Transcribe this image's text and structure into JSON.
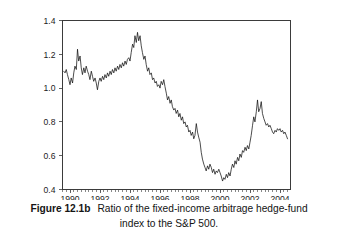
{
  "figure": {
    "label": "Figure 12.1b",
    "caption_line_1": "Ratio of the fixed-income arbitrage hedge-fund",
    "caption_line_2": "index to the S&P 500."
  },
  "colors": {
    "line": "#111111",
    "axis": "#3b3b3b",
    "background": "#ffffff",
    "text": "#141414"
  },
  "chart_data": {
    "type": "line",
    "title": "",
    "subtitle": "",
    "xlabel": "",
    "ylabel": "",
    "xlim": [
      1989.5,
      2004.7
    ],
    "ylim": [
      0.4,
      1.4
    ],
    "grid": false,
    "legend": null,
    "legend_position": "none",
    "x_ticks": [
      1990,
      1992,
      1994,
      1996,
      1998,
      2000,
      2002,
      2004
    ],
    "x_tick_labels": [
      "1990",
      "1992",
      "1994",
      "1996",
      "1998",
      "2000",
      "2002",
      "2004"
    ],
    "x_minor_tick_interval": 0.25,
    "y_ticks": [
      0.4,
      0.6,
      0.8,
      1.0,
      1.2,
      1.4
    ],
    "y_tick_labels": [
      "0.4",
      "0.6",
      "0.8",
      "1.0",
      "1.2",
      "1.4"
    ],
    "series": [
      {
        "name": "Ratio of fixed-income arbitrage hedge-fund index to S&P 500",
        "x": [
          1989.58,
          1989.67,
          1989.75,
          1989.83,
          1989.92,
          1990.0,
          1990.08,
          1990.17,
          1990.25,
          1990.33,
          1990.42,
          1990.5,
          1990.58,
          1990.67,
          1990.75,
          1990.83,
          1990.92,
          1991.0,
          1991.08,
          1991.17,
          1991.25,
          1991.33,
          1991.42,
          1991.5,
          1991.58,
          1991.67,
          1991.75,
          1991.83,
          1991.92,
          1992.0,
          1992.08,
          1992.17,
          1992.25,
          1992.33,
          1992.42,
          1992.5,
          1992.58,
          1992.67,
          1992.75,
          1992.83,
          1992.92,
          1993.0,
          1993.08,
          1993.17,
          1993.25,
          1993.33,
          1993.42,
          1993.5,
          1993.58,
          1993.67,
          1993.75,
          1993.83,
          1993.92,
          1994.0,
          1994.08,
          1994.17,
          1994.25,
          1994.33,
          1994.42,
          1994.5,
          1994.58,
          1994.67,
          1994.75,
          1994.83,
          1994.92,
          1995.0,
          1995.08,
          1995.17,
          1995.25,
          1995.33,
          1995.42,
          1995.5,
          1995.58,
          1995.67,
          1995.75,
          1995.83,
          1995.92,
          1996.0,
          1996.08,
          1996.17,
          1996.25,
          1996.33,
          1996.42,
          1996.5,
          1996.58,
          1996.67,
          1996.75,
          1996.83,
          1996.92,
          1997.0,
          1997.08,
          1997.17,
          1997.25,
          1997.33,
          1997.42,
          1997.5,
          1997.58,
          1997.67,
          1997.75,
          1997.83,
          1997.92,
          1998.0,
          1998.08,
          1998.17,
          1998.25,
          1998.33,
          1998.42,
          1998.5,
          1998.58,
          1998.67,
          1998.75,
          1998.83,
          1998.92,
          1999.0,
          1999.08,
          1999.17,
          1999.25,
          1999.33,
          1999.42,
          1999.5,
          1999.58,
          1999.67,
          1999.75,
          1999.83,
          1999.92,
          2000.0,
          2000.08,
          2000.17,
          2000.25,
          2000.33,
          2000.42,
          2000.5,
          2000.58,
          2000.67,
          2000.75,
          2000.83,
          2000.92,
          2001.0,
          2001.08,
          2001.17,
          2001.25,
          2001.33,
          2001.42,
          2001.5,
          2001.58,
          2001.67,
          2001.75,
          2001.83,
          2001.92,
          2002.0,
          2002.08,
          2002.17,
          2002.25,
          2002.33,
          2002.42,
          2002.5,
          2002.58,
          2002.67,
          2002.75,
          2002.83,
          2002.92,
          2003.0,
          2003.08,
          2003.17,
          2003.25,
          2003.33,
          2003.42,
          2003.5,
          2003.58,
          2003.67,
          2003.75,
          2003.83,
          2003.92,
          2004.0,
          2004.08,
          2004.17,
          2004.25,
          2004.33,
          2004.42,
          2004.5
        ],
        "y": [
          1.1,
          1.09,
          1.11,
          1.08,
          1.05,
          1.02,
          1.06,
          1.03,
          1.09,
          1.13,
          1.11,
          1.23,
          1.16,
          1.19,
          1.12,
          1.08,
          1.12,
          1.09,
          1.13,
          1.1,
          1.08,
          1.05,
          1.1,
          1.07,
          1.04,
          1.06,
          1.03,
          0.99,
          1.04,
          1.06,
          1.04,
          1.07,
          1.05,
          1.08,
          1.06,
          1.09,
          1.07,
          1.1,
          1.08,
          1.11,
          1.09,
          1.12,
          1.1,
          1.13,
          1.11,
          1.14,
          1.12,
          1.15,
          1.13,
          1.16,
          1.14,
          1.17,
          1.18,
          1.16,
          1.21,
          1.26,
          1.24,
          1.31,
          1.27,
          1.33,
          1.28,
          1.31,
          1.25,
          1.21,
          1.17,
          1.19,
          1.14,
          1.1,
          1.12,
          1.08,
          1.09,
          1.05,
          1.06,
          1.03,
          1.04,
          1.01,
          1.02,
          1.0,
          1.04,
          1.02,
          1.05,
          1.01,
          0.97,
          0.93,
          0.95,
          0.91,
          0.93,
          0.89,
          0.87,
          0.88,
          0.85,
          0.87,
          0.83,
          0.85,
          0.81,
          0.83,
          0.79,
          0.8,
          0.77,
          0.78,
          0.74,
          0.75,
          0.72,
          0.74,
          0.7,
          0.72,
          0.79,
          0.74,
          0.71,
          0.68,
          0.62,
          0.58,
          0.55,
          0.53,
          0.51,
          0.54,
          0.52,
          0.55,
          0.53,
          0.5,
          0.52,
          0.49,
          0.51,
          0.5,
          0.52,
          0.5,
          0.48,
          0.45,
          0.47,
          0.46,
          0.49,
          0.47,
          0.5,
          0.48,
          0.52,
          0.55,
          0.53,
          0.57,
          0.55,
          0.59,
          0.57,
          0.61,
          0.59,
          0.63,
          0.62,
          0.65,
          0.63,
          0.66,
          0.64,
          0.68,
          0.72,
          0.78,
          0.83,
          0.8,
          0.86,
          0.93,
          0.86,
          0.88,
          0.92,
          0.85,
          0.82,
          0.8,
          0.78,
          0.79,
          0.77,
          0.78,
          0.76,
          0.74,
          0.73,
          0.75,
          0.74,
          0.76,
          0.75,
          0.76,
          0.74,
          0.75,
          0.73,
          0.74,
          0.72,
          0.7
        ]
      }
    ]
  }
}
